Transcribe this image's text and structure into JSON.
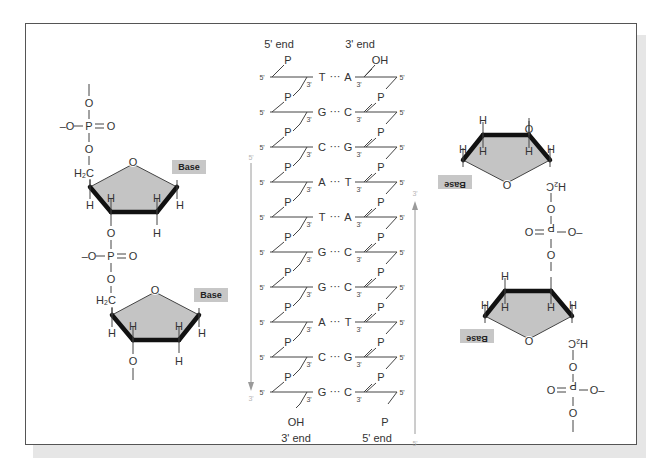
{
  "figure": {
    "type": "dna-structure-diagram",
    "colors": {
      "frame": "#555555",
      "ring_fill": "#c4c4c4",
      "base_box": "#c7c7c7",
      "arrow": "#9a9a9a",
      "shadow": "#e6e6e6"
    }
  },
  "left_strand": {
    "atoms": {
      "top_O": "O",
      "phosphate_minus_O": "–O",
      "phosphate_P": "P",
      "phosphate_double_O": "O",
      "phosphate_bridge_O": "O",
      "ch2": "H₂C",
      "ring_O": "O",
      "H": "H",
      "bottom_O": "O"
    },
    "base_label": "Base"
  },
  "ladder": {
    "top_left_label": "5' end",
    "top_right_label": "3' end",
    "bottom_left_label": "3' end",
    "bottom_right_label": "5' end",
    "top_left_terminal": "P",
    "top_right_terminal": "OH",
    "bottom_left_terminal": "OH",
    "bottom_right_terminal": "P",
    "phosphate": "P",
    "prime5": "5'",
    "prime3": "3'",
    "dots": "···",
    "pairs": [
      {
        "left": "T",
        "right": "A"
      },
      {
        "left": "G",
        "right": "C"
      },
      {
        "left": "C",
        "right": "G"
      },
      {
        "left": "A",
        "right": "T"
      },
      {
        "left": "T",
        "right": "A"
      },
      {
        "left": "G",
        "right": "C"
      },
      {
        "left": "G",
        "right": "C"
      },
      {
        "left": "A",
        "right": "T"
      },
      {
        "left": "C",
        "right": "G"
      },
      {
        "left": "G",
        "right": "C"
      }
    ],
    "down_arrow": {
      "start": "5'",
      "end": "3'"
    },
    "up_arrow": {
      "start": "5'",
      "end": "3'"
    }
  },
  "right_strand": {
    "base_label": "Base",
    "note": "rotated 180° (antiparallel)"
  }
}
